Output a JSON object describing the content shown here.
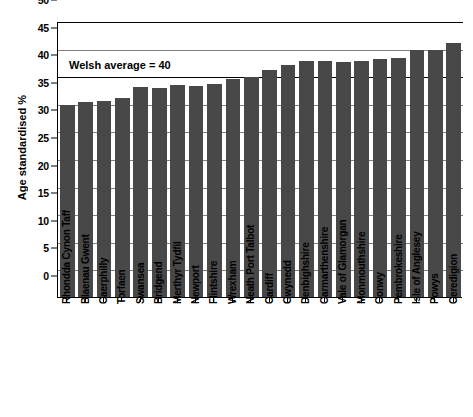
{
  "chart_data": {
    "type": "bar",
    "title": "",
    "xlabel": "",
    "ylabel": "Age standardised %",
    "ylim": [
      0,
      50
    ],
    "ytick_step": 5,
    "yticks": [
      0,
      5,
      10,
      15,
      20,
      25,
      30,
      35,
      40,
      45,
      50
    ],
    "grid": true,
    "legend": "none",
    "bar_color": "#484848",
    "categories": [
      "Rhondda Cynon Taff",
      "Blaenau Gwent",
      "Caerphilly",
      "Torfaen",
      "Swansea",
      "Bridgend",
      "Merthyr Tydfil",
      "Newport",
      "Flintshire",
      "Wrexham",
      "Neath Port Talbot",
      "Cardiff",
      "Gwynedd",
      "Denbighshire",
      "Carmarthenshire",
      "Vale of Glamorgan",
      "Monmouthshire",
      "Conwy",
      "Pembrokeshire",
      "Isle of Anglesey",
      "Powys",
      "Ceredigion"
    ],
    "values": [
      34.7,
      35.3,
      35.5,
      36.0,
      38.0,
      37.8,
      38.4,
      38.3,
      38.6,
      39.5,
      39.8,
      41.2,
      42.0,
      42.7,
      42.7,
      42.6,
      42.7,
      43.2,
      43.3,
      44.7,
      44.7,
      46.1
    ],
    "annotations": [
      {
        "name": "welsh-average-line",
        "label": "Welsh average = 40",
        "value": 40
      }
    ]
  }
}
